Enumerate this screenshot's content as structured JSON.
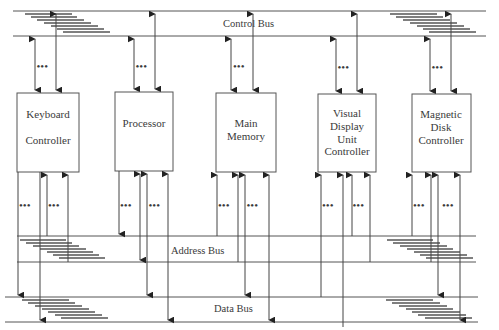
{
  "diagram": {
    "buses": {
      "control": {
        "label": "Control Bus",
        "y_top": 11,
        "y_bottom": 36,
        "x1": 13,
        "x2": 486
      },
      "address": {
        "label": "Address Bus",
        "y_top": 236,
        "y_bottom": 262,
        "x1": 17,
        "x2": 476
      },
      "data": {
        "label": "Data Bus",
        "y_top": 297,
        "y_bottom": 322,
        "x1": 5,
        "x2": 478
      }
    },
    "blocks": [
      {
        "id": "keyboard",
        "lines": [
          "Keyboard",
          "",
          "Controller"
        ],
        "x": 17,
        "y": 93,
        "w": 62,
        "h": 79
      },
      {
        "id": "processor",
        "lines": [
          "Processor"
        ],
        "x": 115,
        "y": 92,
        "w": 58,
        "h": 79
      },
      {
        "id": "main-memory",
        "lines": [
          "Main",
          "Memory"
        ],
        "x": 216,
        "y": 93,
        "w": 60,
        "h": 79
      },
      {
        "id": "vdu",
        "lines": [
          "Visual",
          "Display",
          "Unit",
          "Controller"
        ],
        "x": 318,
        "y": 94,
        "w": 58,
        "h": 78
      },
      {
        "id": "disk",
        "lines": [
          "Magnetic",
          "Disk",
          "Controller"
        ],
        "x": 412,
        "y": 94,
        "w": 59,
        "h": 78
      }
    ],
    "ellipsis": "•••",
    "colors": {
      "line": "#444444",
      "text": "#3a3a3a",
      "background": "#ffffff"
    }
  }
}
